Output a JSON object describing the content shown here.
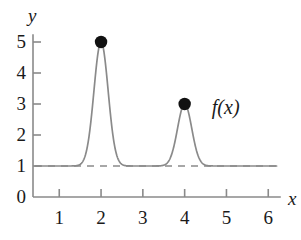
{
  "chart_data": {
    "type": "line",
    "title": "",
    "xlabel": "x",
    "ylabel": "y",
    "xlim": [
      0.35,
      6.35
    ],
    "ylim": [
      0,
      5.35
    ],
    "grid": false,
    "legend": "none",
    "baseline": 1,
    "curve_label": "f(x)",
    "x_ticks": [
      "1",
      "2",
      "3",
      "4",
      "5",
      "6"
    ],
    "x_tick_values": [
      1,
      2,
      3,
      4,
      5,
      6
    ],
    "y_ticks": [
      "0",
      "1",
      "2",
      "3",
      "4",
      "5"
    ],
    "y_tick_values": [
      0,
      1,
      2,
      3,
      4,
      5
    ],
    "series": [
      {
        "name": "f(x)",
        "description": "baseline 1 with two gaussian bumps",
        "baseline": 1,
        "peaks": [
          {
            "x": 2,
            "y": 5,
            "amplitude": 4,
            "sigma": 0.17
          },
          {
            "x": 4,
            "y": 3,
            "amplitude": 2,
            "sigma": 0.17
          }
        ]
      }
    ],
    "markers": [
      {
        "x": 2,
        "y": 5,
        "style": "filled-circle"
      },
      {
        "x": 4,
        "y": 3,
        "style": "filled-circle"
      }
    ],
    "annotations": [
      {
        "text": "f(x)",
        "x": 4.65,
        "y": 3.0
      }
    ],
    "colors": {
      "curve": "#8a8a8a",
      "axis": "#8a8a8a",
      "dashed_baseline": "#8a8a8a",
      "marker": "#111111",
      "text": "#1a1a1a",
      "background": "#ffffff"
    }
  }
}
